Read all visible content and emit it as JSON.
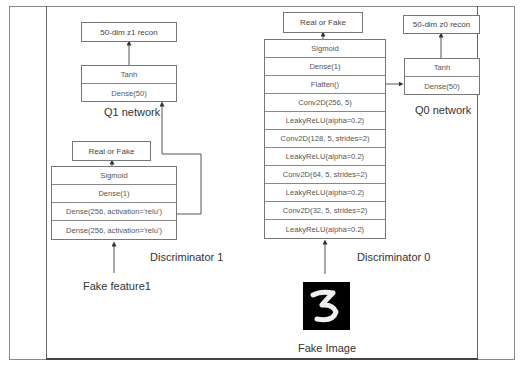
{
  "figure": {
    "caption": ""
  },
  "q1_network": {
    "label": "Q1 network",
    "output": "50-dim z1 recon",
    "layers": [
      "Tanh",
      "Dense(50)"
    ]
  },
  "discriminator_1": {
    "label": "Discriminator 1",
    "output": "Real or Fake",
    "layers": [
      "Sigmoid",
      "Dense(1)",
      "Dense(256, activation='relu')",
      "Dense(256, activation='relu')"
    ],
    "input_label": "Fake feature1"
  },
  "discriminator_0": {
    "label": "Discriminator 0",
    "output": "Real or Fake",
    "layers": [
      "Sigmoid",
      "Dense(1)",
      "Flatten()",
      "Conv2D(256, 5)",
      "LeakyReLU(alpha=0.2)",
      "Conv2D(128, 5, strides=2)",
      "LeakyReLU(alpha=0.2)",
      "Conv2D(64, 5, strides=2)",
      "LeakyReLU(alpha=0.2)",
      "Conv2D(32, 5, strides=2)",
      "LeakyReLU(alpha=0.2)"
    ],
    "input_label": "Fake Image",
    "input_image_digit": "3"
  },
  "q0_network": {
    "label": "Q0 network",
    "output": "50-dim z0 recon",
    "layers": [
      "Tanh",
      "Dense(50)"
    ]
  },
  "colors": {
    "line": "#555555",
    "box_border": "#777777",
    "text": "#444444",
    "image_bg": "#000000"
  }
}
